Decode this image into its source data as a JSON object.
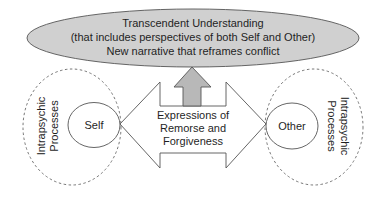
{
  "colors": {
    "ellipse_fill": "#d0d0d0",
    "arrow_fill": "#b8b8b8",
    "stroke": "#555555",
    "dashed_stroke": "#666666",
    "text": "#1f1f1f",
    "background": "#ffffff"
  },
  "top_ellipse": {
    "lines": [
      "Transcendent Understanding",
      "(that includes perspectives of both Self and Other)",
      "New narrative that reframes conflict"
    ]
  },
  "center_arrow": {
    "lines": [
      "Expressions of",
      "Remorse and",
      "Forgiveness"
    ]
  },
  "left": {
    "node_label": "Self",
    "process_lines": [
      "Intrapsychic",
      "Processes"
    ]
  },
  "right": {
    "node_label": "Other",
    "process_lines": [
      "Intrapsychic",
      "Processes"
    ]
  },
  "icons": {
    "up_arrow": "up-arrow-icon",
    "double_arrow": "double-headed-arrow-icon"
  }
}
